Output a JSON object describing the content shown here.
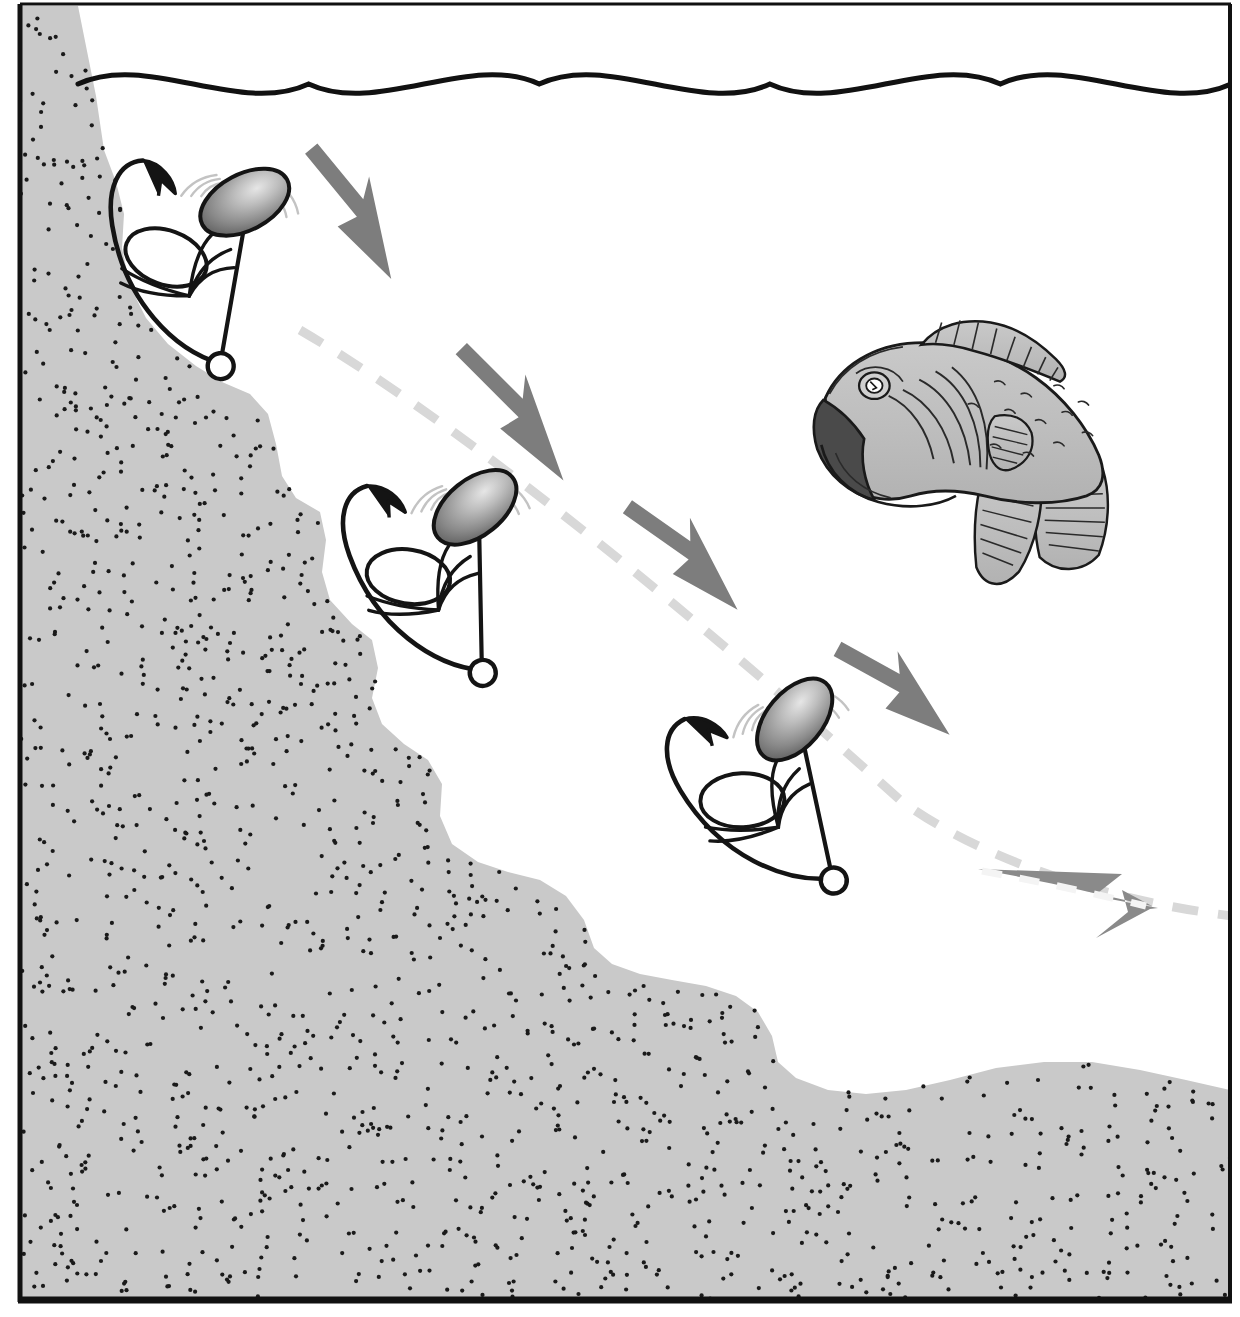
{
  "illustration": {
    "title": "Spinnerbait Slow-Roll Retrieve Down a Drop-Off",
    "subject": "fishing-technique-diagram",
    "background_color": "#ffffff",
    "frame": {
      "border_color": "#111111",
      "left_x": 18,
      "right_x": 1231,
      "top_y": 5,
      "bottom_y": 1301,
      "left_width": 5,
      "right_width": 4,
      "top_width": 3,
      "bottom_width": 7
    },
    "water_surface": {
      "label": "water surface",
      "color": "#111111",
      "stroke_width": 5,
      "start_x": 78,
      "start_y": 84,
      "end_x": 1231,
      "amplitude": 17,
      "wave_count": 5
    },
    "bottom": {
      "label": "lake bottom / drop-off",
      "fill_color": "#c9c9c9",
      "speckle_color": "#1a1a1a",
      "speckle_count": 1500,
      "speckle_radius": 2.1,
      "profile_note": "steep stair-stepped shelf descending left-to-right, flattening to gentle swells on the right"
    },
    "trajectory": {
      "label": "retrieve path",
      "color": "#d8d8d8",
      "stroke_width": 9,
      "dash": "26 20",
      "from_x": 300,
      "from_y": 330,
      "to_x": 1231,
      "to_y": 915
    },
    "direction_arrows": {
      "color": "#7d7d7d",
      "count": 4,
      "items": [
        {
          "name": "arrow-1",
          "x1": 312,
          "y1": 148,
          "x2": 386,
          "y2": 238,
          "label": "retrieve direction"
        },
        {
          "name": "arrow-2",
          "x1": 462,
          "y1": 348,
          "x2": 552,
          "y2": 438,
          "label": "retrieve direction"
        },
        {
          "name": "arrow-3",
          "x1": 628,
          "y1": 506,
          "x2": 722,
          "y2": 572,
          "label": "retrieve direction"
        },
        {
          "name": "arrow-4",
          "x1": 838,
          "y1": 648,
          "x2": 932,
          "y2": 700,
          "label": "retrieve direction"
        }
      ]
    },
    "terminal_arrow": {
      "name": "arrow-along-path",
      "label": "continued retrieve",
      "color": "#8a8a8a",
      "dash_overlay_color": "#f2f2f2",
      "x1": 980,
      "y1": 872,
      "x2": 1158,
      "y2": 908
    },
    "lures": [
      {
        "name": "spinnerbait-position-1",
        "label": "spinnerbait near surface",
        "x": 215,
        "y": 250,
        "rotation": 38,
        "scale": 1.0,
        "blade_color_light": "#cfcfcf",
        "blade_color_dark": "#5d5d5d",
        "wire_color": "#141414"
      },
      {
        "name": "spinnerbait-position-2",
        "label": "spinnerbait mid-depth",
        "x": 455,
        "y": 560,
        "rotation": 27,
        "scale": 1.0,
        "blade_color_light": "#cfcfcf",
        "blade_color_dark": "#5d5d5d",
        "wire_color": "#141414"
      },
      {
        "name": "spinnerbait-position-3",
        "label": "spinnerbait deep",
        "x": 785,
        "y": 775,
        "rotation": 16,
        "scale": 1.0,
        "blade_color_light": "#cfcfcf",
        "blade_color_dark": "#5d5d5d",
        "wire_color": "#141414"
      }
    ],
    "fish": {
      "name": "largemouth-bass",
      "label": "largemouth bass",
      "x": 805,
      "y": 300,
      "width": 340,
      "height": 280,
      "facing": "left",
      "body_color": "#bfbfbf",
      "outline_color": "#1a1a1a",
      "mouth_color": "#4a4a4a"
    }
  }
}
